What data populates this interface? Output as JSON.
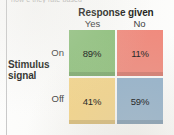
{
  "figure": {
    "clipped_top_text": "how e they rate based",
    "column_header": {
      "title": "Response given",
      "labels": [
        "Yes",
        "No"
      ]
    },
    "row_header": {
      "title_line1": "Stimulus",
      "title_line2": "signal",
      "labels": [
        "On",
        "Off"
      ]
    }
  },
  "chart_data": {
    "type": "heatmap",
    "title": "",
    "xlabel": "Response given",
    "ylabel": "Stimulus signal",
    "categories": [
      "Yes",
      "No"
    ],
    "rows": [
      "On",
      "Off"
    ],
    "grid": false,
    "legend": "none",
    "cells": [
      {
        "row": "On",
        "col": "Yes",
        "value": 89,
        "label": "89%",
        "color": "#8ec07c"
      },
      {
        "row": "On",
        "col": "No",
        "value": 11,
        "label": "11%",
        "color": "#f08b7e"
      },
      {
        "row": "Off",
        "col": "Yes",
        "value": 41,
        "label": "41%",
        "color": "#f4d58a"
      },
      {
        "row": "Off",
        "col": "No",
        "value": 59,
        "label": "59%",
        "color": "#93b2cc"
      }
    ],
    "values": [
      [
        89,
        11
      ],
      [
        41,
        59
      ]
    ],
    "unit": "%"
  },
  "colors": {
    "hit": "#8ec07c",
    "miss": "#f08b7e",
    "false_alarm": "#f4d58a",
    "correct_rejection": "#93b2cc",
    "text": "#231f20",
    "rule": "#c9c9c9"
  }
}
